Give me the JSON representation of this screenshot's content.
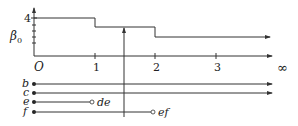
{
  "diagram": {
    "y_axis": {
      "label": "β0",
      "label_main": "β",
      "label_sub": "0",
      "top_tick_label": "4",
      "tick_count": 4
    },
    "x_axis": {
      "origin_label": "O",
      "tick_labels": [
        "1",
        "2",
        "3"
      ],
      "end_label": "∞"
    },
    "step_function": {
      "levels": [
        {
          "from": 0,
          "to": 1,
          "value": 4
        },
        {
          "from": 1,
          "to": 2,
          "value": 3
        },
        {
          "from": 2,
          "to": "∞",
          "value": 2
        }
      ]
    },
    "cursor": {
      "x_position": 1.5
    },
    "barcodes": [
      {
        "label": "b",
        "start": 0,
        "end": "∞",
        "end_label": ""
      },
      {
        "label": "c",
        "start": 0,
        "end": "∞",
        "end_label": ""
      },
      {
        "label": "e",
        "start": 0,
        "end": 1,
        "end_label": "de"
      },
      {
        "label": "f",
        "start": 0,
        "end": 2,
        "end_label": "ef"
      }
    ],
    "colors": {
      "stroke": "#333333",
      "background": "#ffffff"
    }
  }
}
